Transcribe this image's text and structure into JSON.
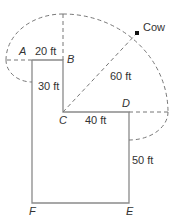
{
  "diagram": {
    "type": "geometry-tether-region",
    "points": {
      "A": "A",
      "B": "B",
      "C": "C",
      "D": "D",
      "E": "E",
      "F": "F"
    },
    "object_label": "Cow",
    "measurements": {
      "AB": "20 ft",
      "BC": "30 ft",
      "CD": "40 ft",
      "DE": "50 ft",
      "rope": "60 ft"
    },
    "colors": {
      "line": "#8a8a8a",
      "dashed": "#777777",
      "text": "#333333",
      "cow": "#111111"
    }
  }
}
